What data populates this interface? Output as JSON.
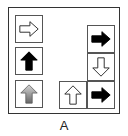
{
  "figure": {
    "caption": "A",
    "cells": [
      {
        "id": "left-1",
        "direction": "right",
        "fill": "white",
        "icon": "arrow-right-outline-icon"
      },
      {
        "id": "left-2",
        "direction": "up",
        "fill": "black",
        "icon": "arrow-up-solid-icon"
      },
      {
        "id": "left-3",
        "direction": "up",
        "fill": "gray-gradient",
        "icon": "arrow-up-gray-icon"
      },
      {
        "id": "bottom-middle",
        "direction": "up",
        "fill": "white",
        "icon": "arrow-up-outline-icon"
      },
      {
        "id": "right-1",
        "direction": "right",
        "fill": "black",
        "icon": "arrow-right-solid-icon"
      },
      {
        "id": "right-2",
        "direction": "down",
        "fill": "white",
        "icon": "arrow-down-outline-icon"
      },
      {
        "id": "right-3",
        "direction": "right",
        "fill": "black",
        "icon": "arrow-right-solid-icon"
      }
    ],
    "colors": {
      "border": "#333333",
      "black_arrow": "#000000",
      "gray_arrow_top": "#d0d0d0",
      "gray_arrow_bottom": "#6a6a6a"
    }
  }
}
